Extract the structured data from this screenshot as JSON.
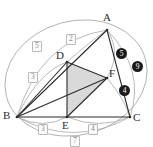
{
  "figure": {
    "kind": "geometry-diagram",
    "colors": {
      "stroke_main": "#2b2b2b",
      "stroke_arc": "#a8a8a8",
      "shade_fill": "#d9d9d9",
      "badge_fill": "#1b1b1b",
      "badge_text": "#ffffff",
      "boxlabel_text": "#8a8a8a",
      "boxlabel_border": "#b9b9b9",
      "background": "#ffffff"
    }
  },
  "vertices": [
    {
      "name": "A",
      "label": "A",
      "x": 107,
      "y": 30
    },
    {
      "name": "B",
      "label": "B",
      "x": 17,
      "y": 117
    },
    {
      "name": "C",
      "label": "C",
      "x": 130,
      "y": 117
    },
    {
      "name": "D",
      "label": "D",
      "x": 67,
      "y": 62
    },
    {
      "name": "E",
      "label": "E",
      "x": 67,
      "y": 117
    },
    {
      "name": "F",
      "label": "F",
      "x": 107,
      "y": 78
    }
  ],
  "vertex_labels": {
    "A": "A",
    "B": "B",
    "C": "C",
    "D": "D",
    "E": "E",
    "F": "F"
  },
  "segments": [
    {
      "name": "AB",
      "from": "A",
      "to": "B"
    },
    {
      "name": "BC",
      "from": "B",
      "to": "C"
    },
    {
      "name": "CA",
      "from": "C",
      "to": "A"
    },
    {
      "name": "DE",
      "from": "D",
      "to": "E"
    },
    {
      "name": "EF",
      "from": "E",
      "to": "F"
    },
    {
      "name": "FD",
      "from": "F",
      "to": "D"
    },
    {
      "name": "BD",
      "from": "B",
      "to": "D"
    },
    {
      "name": "BF",
      "from": "B",
      "to": "F"
    }
  ],
  "shaded_region": {
    "name": "triangle-DEF",
    "vertices": [
      "D",
      "E",
      "F"
    ]
  },
  "box_labels": [
    {
      "name": "arc-label-AD",
      "text": "2",
      "x": 66,
      "y": 34
    },
    {
      "name": "arc-label-BD",
      "text": "5",
      "x": 32,
      "y": 41
    },
    {
      "name": "arc-label-BD-inner",
      "text": "3",
      "x": 28,
      "y": 72
    },
    {
      "name": "arc-label-BE",
      "text": "3",
      "x": 38,
      "y": 124
    },
    {
      "name": "arc-label-EC",
      "text": "4",
      "x": 88,
      "y": 124
    },
    {
      "name": "arc-label-BC",
      "text": "7",
      "x": 70,
      "y": 136
    }
  ],
  "dot_labels": [
    {
      "name": "badge-AF",
      "text": "5",
      "x": 116,
      "y": 48
    },
    {
      "name": "badge-outer",
      "text": "9",
      "x": 132,
      "y": 61
    },
    {
      "name": "badge-FC",
      "text": "4",
      "x": 119,
      "y": 85
    }
  ]
}
